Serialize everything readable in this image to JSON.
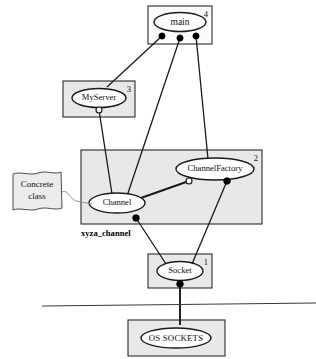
{
  "diagram": {
    "components": [
      {
        "id": "main",
        "label": "main",
        "number": "4",
        "box": {
          "x": 148,
          "y": 6,
          "w": 64,
          "h": 38
        },
        "ellipse": {
          "cx": 180,
          "cy": 22,
          "rx": 26,
          "ry": 9.5
        },
        "shaded": false
      },
      {
        "id": "myserver",
        "label": "MyServer",
        "number": "3",
        "box": {
          "x": 63,
          "y": 81,
          "w": 72,
          "h": 36
        },
        "ellipse": {
          "cx": 99,
          "cy": 98,
          "rx": 27,
          "ry": 9.5
        },
        "shaded": true
      },
      {
        "id": "channel-component",
        "label": "",
        "number": "2",
        "box": {
          "x": 81,
          "y": 150,
          "w": 181,
          "h": 74
        },
        "shaded": true
      },
      {
        "id": "socket",
        "label": "Socket",
        "number": "1",
        "box": {
          "x": 148,
          "y": 254,
          "w": 64,
          "h": 34
        },
        "ellipse": {
          "cx": 180,
          "cy": 271,
          "rx": 23,
          "ry": 9.5
        },
        "shaded": true
      },
      {
        "id": "os-sockets",
        "label": "OS SOCKETS",
        "number": "",
        "box": {
          "x": 128,
          "y": 320,
          "w": 97,
          "h": 36
        },
        "ellipse": {
          "cx": 176,
          "cy": 338,
          "rx": 35,
          "ry": 10
        },
        "shaded": true
      }
    ],
    "inner_nodes": [
      {
        "id": "channelfactory",
        "label": "ChannelFactory",
        "ellipse": {
          "cx": 215,
          "cy": 169,
          "rx": 39,
          "ry": 11
        }
      },
      {
        "id": "channel",
        "label": "Channel",
        "ellipse": {
          "cx": 117,
          "cy": 203,
          "rx": 28,
          "ry": 10
        }
      }
    ],
    "ports": [
      {
        "id": "main-port-left",
        "type": "filled",
        "cx": 162,
        "cy": 36
      },
      {
        "id": "main-port-center",
        "type": "filled",
        "cx": 180,
        "cy": 38
      },
      {
        "id": "main-port-right",
        "type": "filled",
        "cx": 196,
        "cy": 36
      },
      {
        "id": "myserver-port-bottom",
        "type": "hollow",
        "cx": 99,
        "cy": 110
      },
      {
        "id": "channelfactory-port-left",
        "type": "hollow",
        "cx": 189,
        "cy": 181
      },
      {
        "id": "channelfactory-port-right",
        "type": "filled",
        "cx": 227,
        "cy": 181
      },
      {
        "id": "channel-port-bottom",
        "type": "filled",
        "cx": 136,
        "cy": 218
      },
      {
        "id": "socket-port-bottom",
        "type": "filled",
        "cx": 180,
        "cy": 284
      }
    ],
    "connectors": [
      {
        "id": "main-to-myserver",
        "from": "main-port-left",
        "points": "162,36 107,87"
      },
      {
        "id": "main-to-channel",
        "from": "main-port-center",
        "points": "180,38 127,196"
      },
      {
        "id": "main-to-channelfactory",
        "from": "main-port-right",
        "points": "196,36 208,159"
      },
      {
        "id": "myserver-to-channel",
        "from": "myserver-port-bottom",
        "points": "99,110 112,194"
      },
      {
        "id": "channelfactory-to-channel",
        "from": "channelfactory-port-left",
        "points": "189,181 138,199"
      },
      {
        "id": "channel-to-socket",
        "from": "channel-port-bottom",
        "points": "136,218 166,264"
      },
      {
        "id": "channelfactory-to-socket",
        "from": "channelfactory-port-right",
        "points": "227,181 192,264"
      },
      {
        "id": "socket-to-os",
        "from": "socket-port-bottom",
        "points": "180,284 180,325"
      }
    ],
    "divider": {
      "x1": 42,
      "y1": 306,
      "x2": 316,
      "y2": 303
    },
    "note": {
      "id": "concrete-class-note",
      "line1": "Concrete",
      "line2": "class",
      "x": 12,
      "y": 172,
      "w": 50,
      "h": 40,
      "leader": "62,192 78,200 92,204"
    },
    "association_label": {
      "id": "xyza-channel-label",
      "text": "xyza_channel",
      "x": 81,
      "y": 234
    }
  }
}
